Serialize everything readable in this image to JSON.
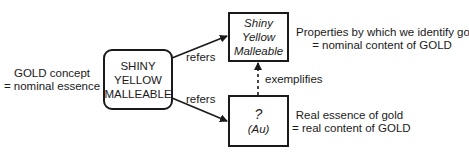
{
  "diagram": {
    "concept_label": {
      "line1": "GOLD concept",
      "line2": "= nominal essence"
    },
    "concept_box": {
      "lines": [
        "SHINY",
        "YELLOW",
        "MALLEABLE"
      ]
    },
    "nominal_box": {
      "lines": [
        "Shiny",
        "Yellow",
        "Malleable"
      ]
    },
    "real_box": {
      "lines": [
        "?",
        "(Au)"
      ]
    },
    "nominal_label": {
      "line1": "Properties by which we identify gold",
      "line2": "= nominal content of GOLD"
    },
    "real_label": {
      "line1": "Real essence of gold",
      "line2": "= real content of GOLD"
    },
    "edges": [
      {
        "from": "concept_box",
        "to": "nominal_box",
        "label": "refers",
        "style": "solid"
      },
      {
        "from": "concept_box",
        "to": "real_box",
        "label": "refers",
        "style": "solid"
      },
      {
        "from": "real_box",
        "to": "nominal_box",
        "label": "exemplifies",
        "style": "dashed"
      }
    ],
    "colors": {
      "stroke": "#1a1a1a",
      "text": "#1a1a1a",
      "background": "#ffffff"
    }
  }
}
